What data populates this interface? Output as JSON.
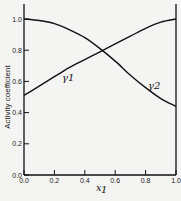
{
  "chart_data": {
    "type": "line",
    "title": "",
    "xlabel": "x1",
    "ylabel": "Activity coefficient",
    "xlim": [
      0.0,
      1.0
    ],
    "ylim": [
      0.0,
      1.0
    ],
    "xticks": [
      "0.0",
      "0.2",
      "0.4",
      "0.6",
      "0.8",
      "1.0"
    ],
    "yticks": [
      "0.0",
      "0.2",
      "0.4",
      "0.6",
      "0.8",
      "1.0"
    ],
    "grid": false,
    "x": [
      0.0,
      0.1,
      0.2,
      0.3,
      0.4,
      0.5,
      0.6,
      0.7,
      0.8,
      0.9,
      1.0
    ],
    "series": [
      {
        "name": "γ1",
        "values": [
          1.0,
          0.99,
          0.97,
          0.93,
          0.88,
          0.81,
          0.73,
          0.64,
          0.56,
          0.49,
          0.44
        ]
      },
      {
        "name": "γ2",
        "values": [
          0.51,
          0.57,
          0.63,
          0.69,
          0.74,
          0.79,
          0.84,
          0.89,
          0.94,
          0.98,
          1.0
        ]
      }
    ],
    "annotations": [
      {
        "text": "γ1",
        "x": 0.36,
        "y": 0.6
      },
      {
        "text": "γ2",
        "x": 0.85,
        "y": 0.56
      }
    ]
  },
  "labels": {
    "ylabel": "Activity coefficient",
    "xlabel": "x",
    "xlabel_sub": "1",
    "gamma1": "γ1",
    "gamma2": "γ2"
  }
}
